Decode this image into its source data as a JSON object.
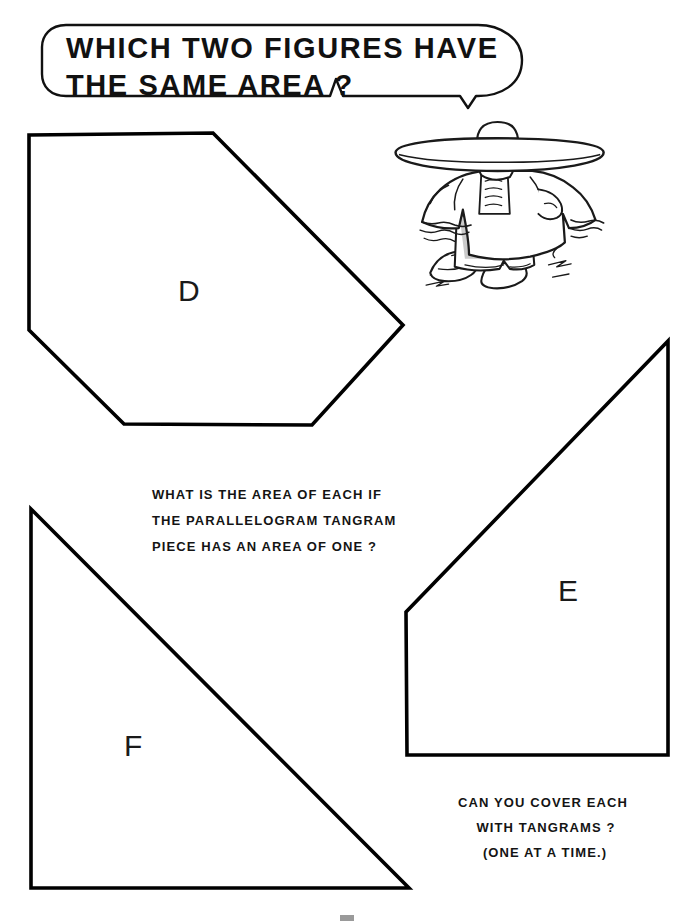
{
  "page": {
    "width": 695,
    "height": 921,
    "background": "#ffffff",
    "ink": "#000000"
  },
  "speech_bubble": {
    "name": "speech-bubble",
    "lines": [
      "WHICH TWO FIGURES HAVE",
      "THE SAME AREA ?"
    ],
    "tail_direction": "down-right"
  },
  "character": {
    "name": "mexican-sombrero-figure",
    "description": "cartoon figure wearing a wide sombrero and poncho, hands on hips"
  },
  "figures": [
    {
      "id": "D",
      "label": "D",
      "shape": "hexagon",
      "points": "29,135 213,133 403,325 312,425 124,424 29,330"
    },
    {
      "id": "E",
      "label": "E",
      "shape": "quadrilateral",
      "points": "668,341 668,755 407,755 406,612"
    },
    {
      "id": "F",
      "label": "F",
      "shape": "right-triangle",
      "points": "31,509 31,888 409,888"
    }
  ],
  "instructions": {
    "middle": [
      "WHAT IS THE AREA OF EACH IF",
      "THE  PARALLELOGRAM  TANGRAM",
      "PIECE  HAS  AN  AREA  OF  ONE ?"
    ],
    "bottom": [
      "CAN  YOU  COVER  EACH",
      "WITH  TANGRAMS ?",
      "(ONE  AT  A  TIME.)"
    ]
  }
}
